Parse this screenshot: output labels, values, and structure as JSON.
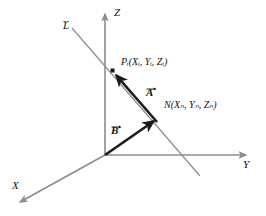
{
  "figure": {
    "background_color": "#ffffff",
    "axis_color": "#8c8c8c",
    "line_color": "#8c8c8c",
    "vector_color": "#1a1a1a",
    "text_color": "#111111"
  },
  "axes": [
    {
      "key": "z",
      "label": "Z",
      "direction": "up"
    },
    {
      "key": "y",
      "label": "Y",
      "direction": "right"
    },
    {
      "key": "x",
      "label": "X",
      "direction": "down-left"
    }
  ],
  "line": {
    "label": "L",
    "accent": "double-headed-arrow"
  },
  "points": [
    {
      "key": "p",
      "name": "P",
      "subscript": "i",
      "coordinates": [
        "X",
        "Y",
        "Z"
      ],
      "coordinate_subscript": "i",
      "label": "Pᵢ(Xᵢ, Yᵢ, Zᵢ)",
      "marker": "square-dot"
    },
    {
      "key": "n",
      "name": "N",
      "subscript": "",
      "coordinates": [
        "X",
        "Y",
        "Z"
      ],
      "coordinate_subscript": "n",
      "label": "N(Xₙ, Yₙ, Zₙ)",
      "marker": "none"
    }
  ],
  "vectors": [
    {
      "key": "a",
      "label": "A",
      "accent": "arrow",
      "from": "N",
      "to": "P",
      "description": "vector A from N toward P along line L"
    },
    {
      "key": "b",
      "label": "B",
      "accent": "arrow",
      "from": "origin",
      "to": "N",
      "description": "vector B from origin to N"
    }
  ]
}
